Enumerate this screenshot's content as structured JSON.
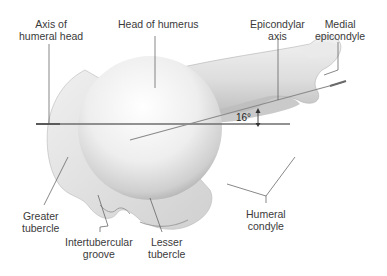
{
  "figure": {
    "labels": {
      "axis_humeral_head": [
        "Axis of",
        "humeral head"
      ],
      "head_of_humerus": [
        "Head of humerus"
      ],
      "epicondylar_axis": [
        "Epicondylar",
        "axis"
      ],
      "medial_epicondyle": [
        "Medial",
        "epicondyle"
      ],
      "greater_tubercle": [
        "Greater",
        "tubercle"
      ],
      "intertubercular_groove": [
        "Intertubercular",
        "groove"
      ],
      "lesser_tubercle": [
        "Lesser",
        "tubercle"
      ],
      "humeral_condyle": [
        "Humeral",
        "condyle"
      ]
    },
    "angle_label": "16°",
    "colors": {
      "background": "#ffffff",
      "bone_light": "#f4f4f4",
      "bone_mid": "#d6d6d6",
      "bone_dark": "#9a9a9a",
      "leader_line": "#555555",
      "axis_line": "#6e6e6e",
      "text": "#3a3a3a"
    }
  }
}
